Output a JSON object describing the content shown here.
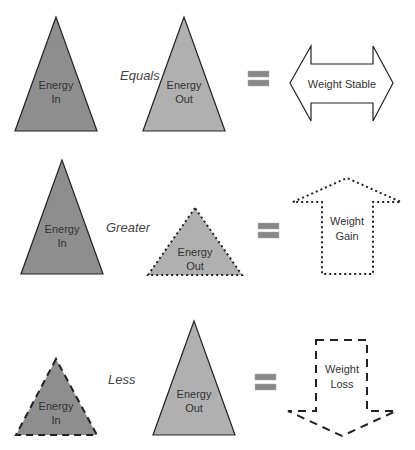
{
  "colors": {
    "energy_in_fill": "#8e8e8e",
    "energy_out_fill": "#b0b0b0",
    "equals_fill": "#888888",
    "stroke": "#222222",
    "text": "#333333"
  },
  "rows": [
    {
      "energy_in": {
        "line1": "Energy",
        "line2": "In"
      },
      "operator": "Equals",
      "energy_out": {
        "line1": "Energy",
        "line2": "Out"
      },
      "result": {
        "line1": "Weight Stable",
        "line2": "",
        "arrow": "double-horizontal",
        "border": "solid"
      }
    },
    {
      "energy_in": {
        "line1": "Energy",
        "line2": "In"
      },
      "operator": "Greater",
      "energy_out": {
        "line1": "Energy",
        "line2": "Out"
      },
      "result": {
        "line1": "Weight",
        "line2": "Gain",
        "arrow": "up",
        "border": "dotted"
      }
    },
    {
      "energy_in": {
        "line1": "Energy",
        "line2": "In"
      },
      "operator": "Less",
      "energy_out": {
        "line1": "Energy",
        "line2": "Out"
      },
      "result": {
        "line1": "Weight",
        "line2": "Loss",
        "arrow": "down",
        "border": "dashed"
      }
    }
  ]
}
